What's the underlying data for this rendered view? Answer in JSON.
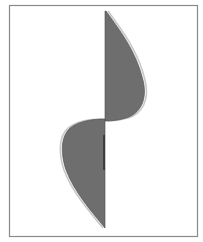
{
  "figure": {
    "colors": {
      "background": "#ffffff",
      "frame": "#8a8a8a",
      "fill": "#6e6e6e",
      "outline": "#c8c8c8",
      "axis_mark": "#2a2a2a"
    },
    "frame": {
      "x": 9,
      "y": 5,
      "width": 188,
      "height": 231
    },
    "axis_x": 105,
    "upper_lobe": {
      "top": [
        106,
        11
      ],
      "max_bulge": [
        143,
        85
      ],
      "bottom": [
        105,
        121
      ],
      "direction": "right"
    },
    "lower_lobe": {
      "top": [
        105,
        119
      ],
      "max_bulge": [
        63,
        145
      ],
      "bottom": [
        105,
        228
      ],
      "direction": "left"
    },
    "axis_mark": {
      "x": 104,
      "y1": 135,
      "y2": 170
    }
  }
}
